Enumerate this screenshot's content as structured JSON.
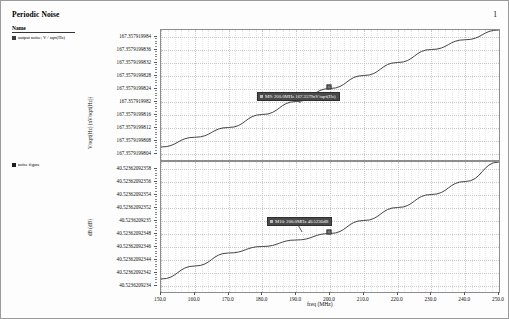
{
  "header": {
    "title": "Periodic Noise",
    "page_number": "1"
  },
  "legends": [
    {
      "name_header": "Name",
      "swatch_color": "#3c3c3c",
      "label": "output noise; V / sqrt(Hz)"
    },
    {
      "swatch_color": "#1e1e1e",
      "label": "noise figure"
    }
  ],
  "markers": [
    {
      "id": "M9",
      "label": "M9: 200.0MHz 167.3579nV/sqrt(Hz)",
      "freq_mhz": 200.0,
      "value": 167.3579,
      "unit": "nV/sqrt(Hz)"
    },
    {
      "id": "M10",
      "label": "M10: 200.0MHz 40.5236dB",
      "freq_mhz": 200.0,
      "value": 40.5236,
      "unit": "dB"
    }
  ],
  "chart_data": [
    {
      "type": "line",
      "panel": "top",
      "title": "",
      "ylabel": "V/sqrt(Hz) (nV/sqrt(Hz))",
      "xlabel": "",
      "xlim": [
        150.0,
        250.0
      ],
      "ylim": [
        167.3579199802,
        167.3579199842
      ],
      "grid": true,
      "legend_position": "left-outside",
      "xticks": [
        "150.0",
        "160.0",
        "170.0",
        "180.0",
        "190.0",
        "200.0",
        "210.0",
        "220.0",
        "230.0",
        "240.0",
        "250.0"
      ],
      "yticks": [
        "167.357919984",
        "167.3579199836",
        "167.3579199832",
        "167.3579199828",
        "167.3579199824",
        "167.357919982",
        "167.3579199816",
        "167.3579199812",
        "167.3579199808",
        "167.3579199804"
      ],
      "series": [
        {
          "name": "output noise; V / sqrt(Hz)",
          "color": "#2f2f2f",
          "x": [
            150.0,
            160.0,
            170.0,
            180.0,
            190.0,
            200.0,
            210.0,
            220.0,
            230.0,
            240.0,
            250.0
          ],
          "values": [
            167.3579199806,
            167.3579199809,
            167.3579199812,
            167.3579199816,
            167.357919982,
            167.3579199824,
            167.3579199828,
            167.3579199832,
            167.3579199836,
            167.3579199839,
            167.3579199842
          ]
        }
      ]
    },
    {
      "type": "line",
      "panel": "bottom",
      "title": "",
      "ylabel": "dB (dB)",
      "xlabel": "freq (MHz)",
      "xlim": [
        150.0,
        250.0
      ],
      "ylim": [
        40.5236209234,
        40.52362092359
      ],
      "grid": true,
      "legend_position": "left-outside",
      "xticks": [
        "150.0",
        "160.0",
        "170.0",
        "180.0",
        "190.0",
        "200.0",
        "210.0",
        "220.0",
        "230.0",
        "240.0",
        "250.0"
      ],
      "yticks": [
        "40.52362092358",
        "40.52362092356",
        "40.52362092354",
        "40.52362092352",
        "40.5236209235",
        "40.52362092348",
        "40.52362092346",
        "40.52362092344",
        "40.52362092342",
        "40.5236209234"
      ],
      "series": [
        {
          "name": "noise figure",
          "color": "#2f2f2f",
          "x": [
            150.0,
            160.0,
            170.0,
            180.0,
            190.0,
            200.0,
            210.0,
            220.0,
            230.0,
            240.0,
            250.0
          ],
          "values": [
            40.52362092341,
            40.52362092343,
            40.52362092345,
            40.52362092346,
            40.52362092347,
            40.52362092348,
            40.5236209235,
            40.52362092352,
            40.52362092354,
            40.52362092356,
            40.52362092359
          ]
        }
      ]
    }
  ]
}
